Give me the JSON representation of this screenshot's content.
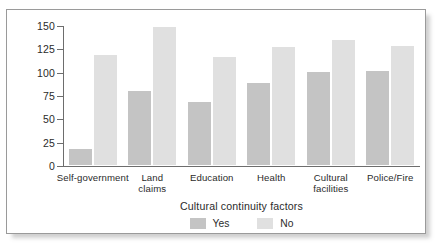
{
  "chart_data": {
    "type": "bar",
    "title": "",
    "xlabel": "Cultural continuity factors",
    "ylabel": "Suicide rate\n(per 100,000)",
    "categories": [
      "Self-government",
      "Land\nclaims",
      "Education",
      "Health",
      "Cultural\nfacilities",
      "Police/Fire"
    ],
    "series": [
      {
        "name": "Yes",
        "color": "#c4c4c4",
        "values": [
          17,
          79,
          67,
          88,
          100,
          101
        ]
      },
      {
        "name": "No",
        "color": "#e0e0e0",
        "values": [
          118,
          148,
          116,
          126,
          134,
          128
        ]
      }
    ],
    "ylim": [
      0,
      150
    ],
    "yticks": [
      0,
      25,
      50,
      75,
      100,
      125,
      150
    ],
    "ytick_labels": [
      "0",
      "25",
      "50",
      "75",
      "100",
      "125",
      "150"
    ],
    "grid": false,
    "legend_position": "bottom-center"
  },
  "legend": {
    "entries": [
      {
        "label": "Yes"
      },
      {
        "label": "No"
      }
    ]
  },
  "colors": {
    "yes_bar": "#c4c4c4",
    "no_bar": "#e0e0e0",
    "axis": "#6d6d6d",
    "frame_border": "#9a9a9a",
    "text": "#2b2b2b"
  }
}
